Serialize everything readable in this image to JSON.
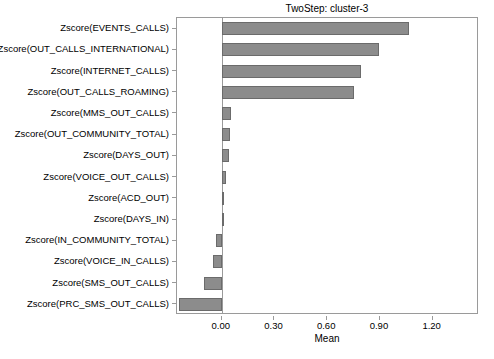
{
  "chart_data": {
    "type": "bar",
    "orientation": "horizontal",
    "title": "TwoStep: cluster-3",
    "xlabel": "Mean",
    "ylabel": "",
    "grid": false,
    "legend": null,
    "xlim": [
      -0.2545,
      1.4636
    ],
    "xticks": [
      0.0,
      0.3,
      0.6,
      0.9,
      1.2
    ],
    "xticklabels": [
      "0.00",
      "0.30",
      "0.60",
      "0.90",
      "1.20"
    ],
    "categories": [
      "Zscore(EVENTS_CALLS)",
      "Zscore(OUT_CALLS_INTERNATIONAL)",
      "Zscore(INTERNET_CALLS)",
      "Zscore(OUT_CALLS_ROAMING)",
      "Zscore(MMS_OUT_CALLS)",
      "Zscore(OUT_COMMUNITY_TOTAL)",
      "Zscore(DAYS_OUT)",
      "Zscore(VOICE_OUT_CALLS)",
      "Zscore(ACD_OUT)",
      "Zscore(DAYS_IN)",
      "Zscore(IN_COMMUNITY_TOTAL)",
      "Zscore(VOICE_IN_CALLS)",
      "Zscore(SMS_OUT_CALLS)",
      "Zscore(PRC_SMS_OUT_CALLS)"
    ],
    "values": [
      1.065,
      0.895,
      0.795,
      0.755,
      0.055,
      0.045,
      0.04,
      0.025,
      0.014,
      0.003,
      -0.03,
      -0.047,
      -0.102,
      -0.245
    ],
    "bar_color": "#8c8c8c",
    "bar_edge_color": "#6b6b6b"
  }
}
